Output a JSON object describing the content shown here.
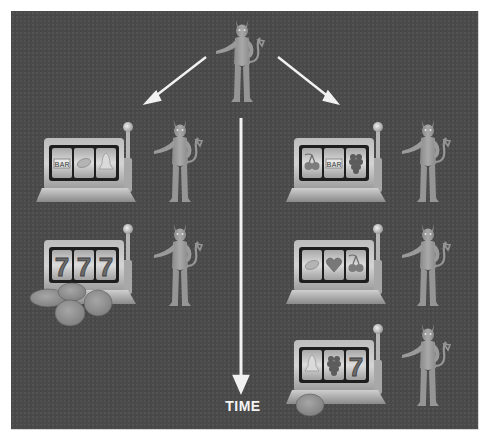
{
  "diagram": {
    "type": "branching timeline illustration",
    "background_color": "#4a4a4a",
    "timeline_label": "TIME",
    "root": {
      "figure": "devil-figure",
      "position": "top-center"
    },
    "branches": [
      {
        "side": "left",
        "rows": [
          {
            "reels": [
              "BAR",
              "lemon",
              "bell"
            ],
            "coins": 0,
            "figure": "devil-figure"
          },
          {
            "reels": [
              "7",
              "7",
              "7"
            ],
            "coins": 5,
            "figure": "devil-figure"
          }
        ]
      },
      {
        "side": "right",
        "rows": [
          {
            "reels": [
              "cherry",
              "BAR",
              "grape"
            ],
            "coins": 0,
            "figure": "devil-figure"
          },
          {
            "reels": [
              "lemon",
              "heart",
              "cherry"
            ],
            "coins": 0,
            "figure": "devil-figure"
          },
          {
            "reels": [
              "bell",
              "grape",
              "7"
            ],
            "coins": 1,
            "figure": "devil-figure"
          }
        ]
      }
    ],
    "reel_text": {
      "bar": "BAR",
      "seven": "7"
    }
  }
}
